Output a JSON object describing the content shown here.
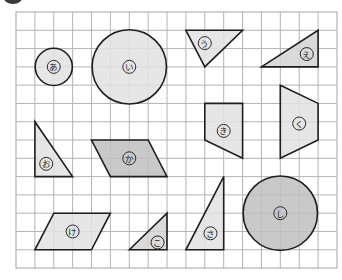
{
  "header": {
    "badge": {
      "shape": "dark-semicircle",
      "color": "#3a3a3a"
    }
  },
  "grid": {
    "columns": 17,
    "rows": 14,
    "left": 16,
    "top": 12,
    "cell_width": 18.88,
    "cell_height": 18.29,
    "line_color": "#b4b4b4"
  },
  "colors": {
    "light": "#e2e2e2",
    "medium": "#d4d4d4",
    "dark": "#c0c0c0",
    "outline": "#1e1e1e"
  },
  "shapes": [
    {
      "id": "a",
      "label": "あ",
      "type": "circle",
      "center": [
        2,
        3
      ],
      "radius": 1,
      "fill": "light",
      "label_at": [
        2,
        3
      ]
    },
    {
      "id": "i",
      "label": "い",
      "type": "circle",
      "center": [
        6,
        3
      ],
      "radius": 2,
      "fill": "light",
      "label_at": [
        6,
        3
      ]
    },
    {
      "id": "u",
      "label": "う",
      "type": "polygon",
      "points": [
        [
          9,
          1
        ],
        [
          12,
          1
        ],
        [
          10,
          3
        ]
      ],
      "fill": "light",
      "label_at": [
        10,
        1.7
      ]
    },
    {
      "id": "e",
      "label": "え",
      "type": "polygon",
      "points": [
        [
          13,
          3
        ],
        [
          16,
          1
        ],
        [
          16,
          3
        ]
      ],
      "fill": "medium",
      "label_at": [
        15.4,
        2.3
      ]
    },
    {
      "id": "o",
      "label": "お",
      "type": "polygon",
      "points": [
        [
          1,
          6
        ],
        [
          1,
          9
        ],
        [
          3,
          9
        ]
      ],
      "fill": "light",
      "label_at": [
        1.6,
        8.3
      ]
    },
    {
      "id": "ka",
      "label": "か",
      "type": "polygon",
      "points": [
        [
          4,
          7
        ],
        [
          7,
          7
        ],
        [
          8,
          9
        ],
        [
          5,
          9
        ]
      ],
      "fill": "dark",
      "label_at": [
        6,
        8
      ]
    },
    {
      "id": "ki",
      "label": "き",
      "type": "polygon",
      "points": [
        [
          10,
          5
        ],
        [
          12,
          5
        ],
        [
          12,
          8
        ],
        [
          10,
          7
        ]
      ],
      "fill": "light",
      "label_at": [
        11,
        6.5
      ]
    },
    {
      "id": "ku",
      "label": "く",
      "type": "polygon",
      "points": [
        [
          14,
          4
        ],
        [
          16,
          5
        ],
        [
          16,
          7
        ],
        [
          14,
          8
        ]
      ],
      "fill": "light",
      "label_at": [
        15,
        6.1
      ]
    },
    {
      "id": "ke",
      "label": "け",
      "type": "polygon",
      "points": [
        [
          2,
          11
        ],
        [
          5,
          11
        ],
        [
          4,
          13
        ],
        [
          1,
          13
        ]
      ],
      "fill": "light",
      "label_at": [
        3,
        12
      ]
    },
    {
      "id": "ko",
      "label": "こ",
      "type": "polygon",
      "points": [
        [
          6,
          13
        ],
        [
          8,
          11
        ],
        [
          8,
          13
        ]
      ],
      "fill": "medium",
      "label_at": [
        7.5,
        12.6
      ]
    },
    {
      "id": "sa",
      "label": "さ",
      "type": "polygon",
      "points": [
        [
          11,
          9
        ],
        [
          9,
          13
        ],
        [
          11,
          13
        ]
      ],
      "fill": "light",
      "label_at": [
        10.3,
        12.1
      ]
    },
    {
      "id": "shi",
      "label": "し",
      "type": "circle",
      "center": [
        14,
        11
      ],
      "radius": 2,
      "fill": "dark",
      "label_at": [
        14,
        11
      ]
    }
  ]
}
